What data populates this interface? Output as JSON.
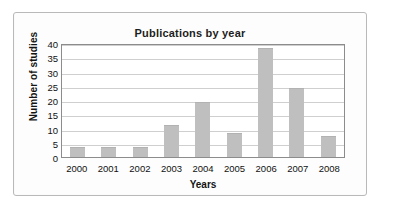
{
  "chart_data": {
    "type": "bar",
    "title": "Publications by year",
    "xlabel": "Years",
    "ylabel": "Number of studies",
    "categories": [
      "2000",
      "2001",
      "2002",
      "2003",
      "2004",
      "2005",
      "2006",
      "2007",
      "2008"
    ],
    "values": [
      3,
      3,
      3,
      11,
      19,
      8,
      38,
      24,
      7
    ],
    "ylim": [
      0,
      40
    ],
    "yticks": [
      0,
      5,
      10,
      15,
      20,
      25,
      30,
      35,
      40
    ],
    "grid": true,
    "legend": null,
    "bar_color": "#bfbfbf",
    "axis_color": "#8c8c8c",
    "grid_color": "#cfcfcf",
    "text_color": "#111111"
  }
}
